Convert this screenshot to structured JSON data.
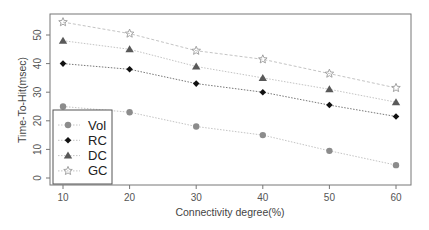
{
  "chart_data": {
    "type": "line",
    "title": "",
    "xlabel": "Connectivity degree(%)",
    "ylabel": "Time-To-Hit(msec)",
    "x": [
      10,
      20,
      30,
      40,
      50,
      60
    ],
    "xticks": [
      "10",
      "20",
      "30",
      "40",
      "50",
      "60"
    ],
    "yticks": [
      "0",
      "10",
      "20",
      "30",
      "40",
      "50"
    ],
    "xlim": [
      7,
      62
    ],
    "ylim": [
      -2,
      57
    ],
    "grid": false,
    "legend_position": "lower left",
    "series": [
      {
        "name": "Vol",
        "marker": "circle",
        "color": "#8c8c8c",
        "line": "dotted",
        "values": [
          25,
          23,
          18,
          15,
          9.5,
          4.5
        ]
      },
      {
        "name": "RC",
        "marker": "diamond",
        "color": "#111111",
        "line": "dotted",
        "values": [
          40,
          38,
          33,
          30,
          25.5,
          21.5
        ]
      },
      {
        "name": "DC",
        "marker": "triangle",
        "color": "#595959",
        "line": "dotted",
        "values": [
          48,
          45,
          39,
          35,
          31,
          26.5
        ]
      },
      {
        "name": "GC",
        "marker": "star",
        "color": "#9a9a9a",
        "line": "dashed",
        "values": [
          54.5,
          50.5,
          44.5,
          41.5,
          36.5,
          31.5
        ]
      }
    ]
  }
}
